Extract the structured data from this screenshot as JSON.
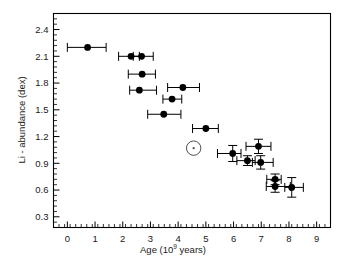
{
  "figure": {
    "name": "lithium-abundance-vs-age-scatter",
    "background_color": "#ffffff",
    "frame_color": "#000000",
    "marker_color": "#000000",
    "errorbar_color": "#000000",
    "sun_symbol_color": "#4d4d4d"
  },
  "chart_data": {
    "type": "scatter",
    "title": "",
    "subtitle": "",
    "xlabel": "Age (10^9 years)",
    "xlabel_text": "Age (10",
    "xlabel_exponent": "9",
    "xlabel_tail": " years)",
    "ylabel": "Li - abundance (dex)",
    "xlim": [
      -0.5,
      9.5
    ],
    "ylim": [
      0.18,
      2.58
    ],
    "xticks": [
      0,
      1,
      2,
      3,
      4,
      5,
      6,
      7,
      8,
      9
    ],
    "xtick_labels": [
      "0",
      "1",
      "2",
      "3",
      "4",
      "5",
      "6",
      "7",
      "8",
      "9"
    ],
    "yticks": [
      0.3,
      0.6,
      0.9,
      1.2,
      1.5,
      1.8,
      2.1,
      2.4
    ],
    "ytick_labels": [
      "0.3",
      "0.6",
      "0.9",
      "1.2",
      "1.5",
      "1.8",
      "2.1",
      "2.4"
    ],
    "x_minor_tick_interval": 0.2,
    "y_minor_tick_interval": 0.06,
    "grid": false,
    "legend": null,
    "legend_position": "none",
    "marker_shape": "filled-circle",
    "marker_size_px": 6,
    "points": [
      {
        "x": 0.73,
        "y": 2.2,
        "xerr_low": 0.73,
        "xerr_high": 0.67,
        "yerr": 0.0
      },
      {
        "x": 2.3,
        "y": 2.1,
        "xerr_low": 0.45,
        "xerr_high": 0.3,
        "yerr": 0.0
      },
      {
        "x": 2.68,
        "y": 2.1,
        "xerr_low": 0.3,
        "xerr_high": 0.42,
        "yerr": 0.0
      },
      {
        "x": 2.7,
        "y": 1.9,
        "xerr_low": 0.5,
        "xerr_high": 0.48,
        "yerr": 0.0
      },
      {
        "x": 2.6,
        "y": 1.72,
        "xerr_low": 0.35,
        "xerr_high": 0.62,
        "yerr": 0.0
      },
      {
        "x": 4.17,
        "y": 1.75,
        "xerr_low": 0.55,
        "xerr_high": 0.6,
        "yerr": 0.0
      },
      {
        "x": 3.78,
        "y": 1.62,
        "xerr_low": 0.33,
        "xerr_high": 0.35,
        "yerr": 0.0
      },
      {
        "x": 3.48,
        "y": 1.45,
        "xerr_low": 0.58,
        "xerr_high": 0.62,
        "yerr": 0.0
      },
      {
        "x": 5.0,
        "y": 1.29,
        "xerr_low": 0.48,
        "xerr_high": 0.45,
        "yerr": 0.0
      },
      {
        "x": 5.97,
        "y": 1.01,
        "xerr_low": 0.55,
        "xerr_high": 0.3,
        "yerr": 0.09
      },
      {
        "x": 6.9,
        "y": 1.09,
        "xerr_low": 0.45,
        "xerr_high": 0.45,
        "yerr": 0.08
      },
      {
        "x": 6.5,
        "y": 0.93,
        "xerr_low": 0.38,
        "xerr_high": 0.28,
        "yerr": 0.055
      },
      {
        "x": 6.98,
        "y": 0.91,
        "xerr_low": 0.3,
        "xerr_high": 0.45,
        "yerr": 0.075
      },
      {
        "x": 7.5,
        "y": 0.72,
        "xerr_low": 0.3,
        "xerr_high": 0.22,
        "yerr": 0.06
      },
      {
        "x": 7.5,
        "y": 0.64,
        "xerr_low": 0.32,
        "xerr_high": 0.55,
        "yerr": 0.065
      },
      {
        "x": 8.1,
        "y": 0.63,
        "xerr_low": 0.25,
        "xerr_high": 0.42,
        "yerr": 0.11
      }
    ],
    "annotations": [
      {
        "label": "sun-symbol",
        "symbol": "☉",
        "x": 4.56,
        "y": 1.07,
        "description": "Sun reference marker (open circle with central dot)"
      }
    ]
  }
}
